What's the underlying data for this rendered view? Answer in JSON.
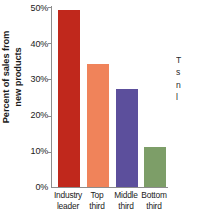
{
  "chart_data": {
    "type": "bar",
    "title": "",
    "xlabel": "",
    "ylabel": "Percent of sales from new products",
    "ylabel_lines": [
      "Percent of sales from",
      "new products"
    ],
    "categories": [
      "Industry leader",
      "Top third",
      "Middle third",
      "Bottom third"
    ],
    "category_lines": [
      [
        "Industry",
        "leader"
      ],
      [
        "Top",
        "third"
      ],
      [
        "Middle",
        "third"
      ],
      [
        "Bottom",
        "third"
      ]
    ],
    "values": [
      49,
      34,
      27,
      11
    ],
    "value_labels": [
      "49%",
      "34%",
      "27%",
      "11%"
    ],
    "colors": [
      "#c0281c",
      "#f0835a",
      "#5c4f9c",
      "#7d9e68"
    ],
    "ylim": [
      0,
      50
    ],
    "yticks": [
      0,
      10,
      20,
      30,
      40,
      50
    ],
    "ytick_labels": [
      "0%",
      "10%",
      "20%",
      "30%",
      "40%",
      "50%"
    ],
    "grid": false,
    "legend": false,
    "axis_color": "#8d8d8d"
  },
  "side_caption": {
    "lines": [
      "T",
      "s",
      "n",
      "l"
    ]
  }
}
